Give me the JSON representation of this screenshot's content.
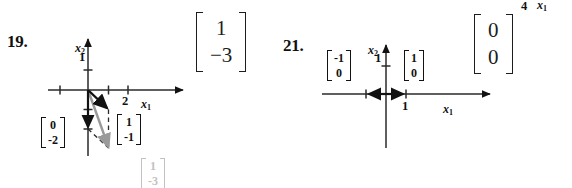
{
  "page": {
    "width": 572,
    "height": 188,
    "background": "#ffffff",
    "ink": "#121212",
    "gray_vector_color": "#9a9a9a",
    "ghost_color": "#c2c2c2"
  },
  "cut_off_top": {
    "tick_label": "4",
    "axis_label": "x",
    "axis_sub": "1"
  },
  "problems": [
    {
      "number": "19.",
      "axes": {
        "x_label": "x",
        "x_sub": "1",
        "y_label": "x",
        "y_sub": "2",
        "x_tick_labels": [
          "2"
        ],
        "y_tick_labels": [
          "1"
        ]
      },
      "vectors": [
        {
          "name": "u",
          "label_top": "1",
          "label_bottom": "-1",
          "style": "solid-black",
          "components": [
            1,
            -1
          ]
        },
        {
          "name": "v",
          "label_top": "0",
          "label_bottom": "-2",
          "style": "solid-black",
          "components": [
            0,
            -2
          ]
        },
        {
          "name": "sum",
          "label_top": "1",
          "label_bottom": "-3",
          "style": "solid-gray",
          "components": [
            1,
            -3
          ],
          "ghost": true
        }
      ],
      "answer": {
        "top": "1",
        "bottom": "−3"
      }
    },
    {
      "number": "21.",
      "axes": {
        "x_label": "x",
        "x_sub": "1",
        "y_label": "x",
        "y_sub": "2",
        "x_tick_labels": [
          "1"
        ],
        "y_tick_labels": [
          "1"
        ]
      },
      "vectors": [
        {
          "name": "u",
          "label_top": "-1",
          "label_bottom": "0",
          "style": "solid-black",
          "components": [
            -1,
            0
          ]
        },
        {
          "name": "v",
          "label_top": "1",
          "label_bottom": "0",
          "style": "solid-black",
          "components": [
            1,
            0
          ]
        }
      ],
      "answer": {
        "top": "0",
        "bottom": "0"
      }
    }
  ]
}
